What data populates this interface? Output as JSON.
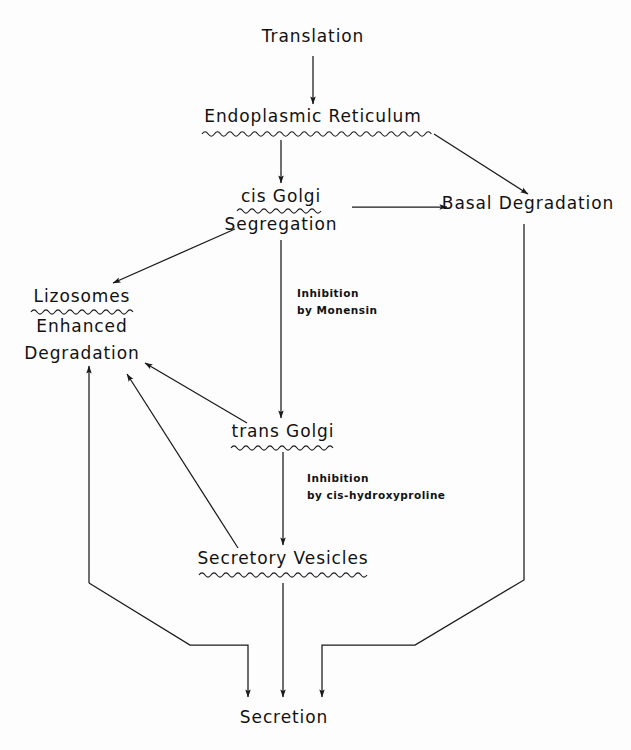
{
  "diagram": {
    "background_color": "#fdfdfd",
    "ink_color": "#1a1a1a",
    "nodes": [
      {
        "id": "translation",
        "label": "Translation",
        "x": 313,
        "y": 42,
        "underline": "none"
      },
      {
        "id": "endoplasmic",
        "label": "Endoplasmic  Reticulum",
        "x": 313,
        "y": 122,
        "underline": "wavy"
      },
      {
        "id": "cis_golgi",
        "label": "cis  Golgi",
        "x": 281,
        "y": 202,
        "underline": "wavy"
      },
      {
        "id": "segregation",
        "label": "Segregation",
        "x": 281,
        "y": 228,
        "underline": "none"
      },
      {
        "id": "basal_degradation",
        "label": "Basal Degradation",
        "x": 528,
        "y": 209,
        "underline": "none"
      },
      {
        "id": "lizosomes",
        "label": "Lizosomes",
        "x": 82,
        "y": 302,
        "underline": "wavy"
      },
      {
        "id": "enhanced",
        "label": "Enhanced",
        "x": 82,
        "y": 330,
        "underline": "none"
      },
      {
        "id": "degradation",
        "label": "Degradation",
        "x": 82,
        "y": 357,
        "underline": "none"
      },
      {
        "id": "trans_golgi",
        "label": "trans Golgi",
        "x": 283,
        "y": 437,
        "underline": "wavy"
      },
      {
        "id": "secretory_vesicles",
        "label": "Secretory Vesicles",
        "x": 283,
        "y": 564,
        "underline": "wavy"
      },
      {
        "id": "secretion",
        "label": "Secretion",
        "x": 284,
        "y": 723,
        "underline": "none"
      }
    ],
    "notes": [
      {
        "id": "monensin",
        "line1": "Inhibition",
        "line2": "by Monensin",
        "x": 297,
        "y": 297
      },
      {
        "id": "cis_hydroxyproline",
        "line1": "Inhibition",
        "line2": "by cis-hydroxyproline",
        "x": 307,
        "y": 482
      }
    ],
    "edges": [
      {
        "id": "translation-to-er",
        "from": "translation",
        "to": "endoplasmic",
        "kind": "arrow-down"
      },
      {
        "id": "er-to-cis-golgi",
        "from": "endoplasmic",
        "to": "cis_golgi",
        "kind": "arrow-down"
      },
      {
        "id": "er-to-basal-degradation",
        "from": "endoplasmic",
        "to": "basal_degradation",
        "kind": "arrow-diagonal"
      },
      {
        "id": "cis-golgi-to-basal-degradation",
        "from": "cis_golgi",
        "to": "basal_degradation",
        "kind": "arrow-right"
      },
      {
        "id": "cis-golgi-to-lizosomes",
        "from": "cis_golgi",
        "to": "lizosomes",
        "kind": "arrow-diagonal"
      },
      {
        "id": "cis-golgi-to-trans-golgi",
        "from": "segregation",
        "to": "trans_golgi",
        "kind": "arrow-down"
      },
      {
        "id": "trans-golgi-to-degradation",
        "from": "trans_golgi",
        "to": "degradation",
        "kind": "arrow-diagonal"
      },
      {
        "id": "trans-golgi-to-vesicles",
        "from": "trans_golgi",
        "to": "secretory_vesicles",
        "kind": "arrow-down"
      },
      {
        "id": "vesicles-to-degradation",
        "from": "secretory_vesicles",
        "to": "degradation",
        "kind": "arrow-diagonal"
      },
      {
        "id": "vesicles-to-secretion",
        "from": "secretory_vesicles",
        "to": "secretion",
        "kind": "arrow-down"
      },
      {
        "id": "degradation-to-secretion",
        "from": "degradation",
        "to": "secretion",
        "kind": "elbow"
      },
      {
        "id": "basal-degradation-to-secretion",
        "from": "basal_degradation",
        "to": "secretion",
        "kind": "elbow"
      }
    ]
  }
}
